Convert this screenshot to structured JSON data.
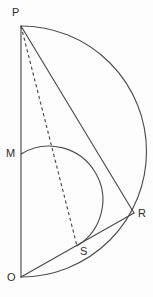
{
  "figure": {
    "background_color": "#fdfdfd",
    "line_color": "#4a4a4a",
    "label_color": "#2e2e2e",
    "width": 153,
    "height": 297,
    "points": [
      {
        "id": "P",
        "label": "P",
        "x": 21,
        "y": 26,
        "label_x": 12,
        "label_y": 7
      },
      {
        "id": "M",
        "label": "M",
        "x": 21,
        "y": 154,
        "label_x": 6,
        "label_y": 148
      },
      {
        "id": "R",
        "label": "R",
        "x": 134,
        "y": 213,
        "label_x": 138,
        "label_y": 208
      },
      {
        "id": "S",
        "label": "S",
        "x": 77,
        "y": 246,
        "label_x": 80,
        "label_y": 246
      },
      {
        "id": "O",
        "label": "O",
        "x": 21,
        "y": 277,
        "label_x": 7,
        "label_y": 272
      }
    ],
    "segments": [
      {
        "id": "OP",
        "from": "P",
        "to": "O",
        "style": "solid",
        "path": "M 21 26 L 21 277"
      },
      {
        "id": "PR",
        "from": "P",
        "to": "R",
        "style": "solid",
        "path": "M 21 26 L 134 213"
      },
      {
        "id": "OR",
        "from": "O",
        "to": "R",
        "style": "solid",
        "path": "M 21 277 L 134 213"
      },
      {
        "id": "PS",
        "from": "P",
        "to": "S",
        "style": "dashed",
        "path": "M 21 26 L 77 246"
      }
    ],
    "arcs": [
      {
        "id": "semicircle-PRO",
        "description": "Large semicircle on diameter PO, centre M, passing through R",
        "center": "M",
        "radius": 125,
        "from": "P",
        "to": "O",
        "path": "M 21 26 A 125 125 0 0 1 21 277"
      },
      {
        "id": "semicircle-MS",
        "description": "Small semicircle on diameter MS-side, from M curving right to S",
        "center_x": 21,
        "center_y": 200,
        "radius": 46,
        "from": "M",
        "to": "S",
        "path": "M 21 154 A 46 46 0 0 1 77 246"
      }
    ]
  }
}
